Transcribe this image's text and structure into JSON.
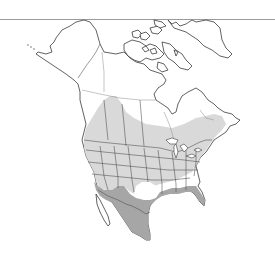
{
  "map": {
    "title": "Species range map — North America",
    "region": "North America",
    "legend": [
      {
        "label": "Breeding / summer range",
        "color": "#d9d9d9"
      },
      {
        "label": "Year-round range",
        "color": "#a6a6a6"
      },
      {
        "label": "Not present",
        "color": "#ffffff"
      }
    ],
    "colors": {
      "background": "#ffffff",
      "outline": "#3a3a3a",
      "top_rule": "#9a9a9a",
      "summer_range": "#d9d9d9",
      "year_round_range": "#a6a6a6"
    }
  }
}
